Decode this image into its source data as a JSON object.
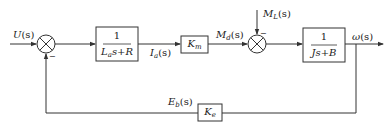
{
  "diagram": {
    "type": "block-diagram",
    "colors": {
      "line": "#333333",
      "background": "#ffffff"
    },
    "signals": {
      "input": {
        "main": "U",
        "sub": "",
        "arg": "(s)"
      },
      "armature_current": {
        "main": "I",
        "sub": "a",
        "arg": "(s)"
      },
      "motor_torque": {
        "main": "M",
        "sub": "d",
        "arg": "(s)"
      },
      "load_torque": {
        "main": "M",
        "sub": "L",
        "arg": "(s)"
      },
      "output": {
        "main": "ω",
        "sub": "",
        "arg": "(s)"
      },
      "back_emf": {
        "main": "E",
        "sub": "b",
        "arg": "(s)"
      }
    },
    "blocks": {
      "electrical": {
        "numerator": "1",
        "den_main": "L",
        "den_sub": "a",
        "den_rest": "s+R"
      },
      "torque_constant": {
        "main": "K",
        "sub": "m"
      },
      "mechanical": {
        "numerator": "1",
        "denominator": "Js+B"
      },
      "emf_constant": {
        "main": "K",
        "sub": "e"
      }
    },
    "summing_junctions": [
      {
        "id": "sum1",
        "plus_input": "U(s)",
        "minus_input": "E_b(s)",
        "minus_sign": "−"
      },
      {
        "id": "sum2",
        "plus_input": "M_d(s)",
        "minus_input": "M_L(s)",
        "minus_sign": "−"
      }
    ]
  }
}
